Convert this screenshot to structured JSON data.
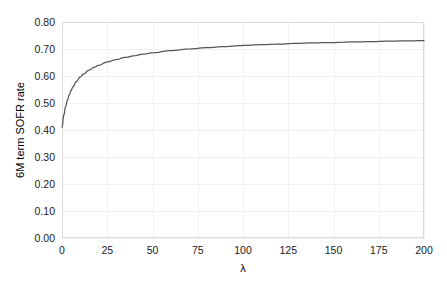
{
  "chart_data": {
    "type": "line",
    "title": "",
    "xlabel": "λ",
    "ylabel": "6M term SOFR rate",
    "xlim": [
      0,
      200
    ],
    "ylim": [
      0.0,
      0.8
    ],
    "grid": true,
    "legend": null,
    "xticks": [
      0,
      25,
      50,
      75,
      100,
      125,
      150,
      175,
      200
    ],
    "xtick_labels": [
      "0",
      "25",
      "50",
      "75",
      "100",
      "125",
      "150",
      "175",
      "200"
    ],
    "yticks": [
      0.0,
      0.1,
      0.2,
      0.3,
      0.4,
      0.5,
      0.6,
      0.7,
      0.8
    ],
    "ytick_labels": [
      "0.00",
      "0.10",
      "0.20",
      "0.30",
      "0.40",
      "0.50",
      "0.60",
      "0.70",
      "0.80"
    ],
    "series": [
      {
        "name": "6M term SOFR rate",
        "color": "#555555",
        "x": [
          0,
          1,
          2,
          3,
          4,
          5,
          6,
          8,
          10,
          12,
          15,
          18,
          20,
          25,
          30,
          35,
          40,
          45,
          50,
          60,
          70,
          80,
          90,
          100,
          110,
          120,
          130,
          140,
          150,
          160,
          170,
          180,
          190,
          200
        ],
        "y": [
          0.41,
          0.455,
          0.487,
          0.511,
          0.53,
          0.546,
          0.559,
          0.58,
          0.596,
          0.608,
          0.622,
          0.633,
          0.639,
          0.652,
          0.661,
          0.669,
          0.675,
          0.681,
          0.686,
          0.694,
          0.7,
          0.705,
          0.709,
          0.713,
          0.716,
          0.718,
          0.721,
          0.723,
          0.724,
          0.726,
          0.727,
          0.729,
          0.73,
          0.731
        ]
      }
    ]
  },
  "axes": {
    "ylabel_text": "6M term SOFR rate",
    "xlabel_text": "λ"
  }
}
